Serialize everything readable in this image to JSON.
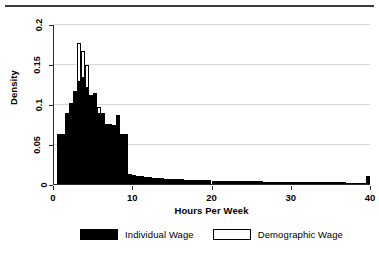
{
  "chart_data": {
    "type": "bar",
    "title": "",
    "subtitle": "",
    "xlabel": "Hours Per Week",
    "ylabel": "Density",
    "xlim": [
      0,
      40
    ],
    "ylim": [
      0,
      0.2
    ],
    "xticks": [
      0,
      10,
      20,
      30,
      40
    ],
    "xtick_labels": [
      "0",
      "10",
      "20",
      "30",
      "40"
    ],
    "yticks": [
      0,
      0.05,
      0.1,
      0.15,
      0.2
    ],
    "ytick_labels": [
      "0",
      "0.05",
      "0.1",
      "0.15",
      "0.2"
    ],
    "grid": "horizontal",
    "legend_position": "bottom",
    "bin_width": 0.5,
    "bin_starts": [
      0,
      0.5,
      1,
      1.5,
      2,
      2.5,
      3,
      3.5,
      4,
      4.5,
      5,
      5.5,
      6,
      6.5,
      7,
      7.5,
      8,
      8.5,
      9,
      9.5,
      10,
      10.5,
      11,
      11.5,
      12,
      12.5,
      13,
      13.5,
      14,
      14.5,
      15,
      15.5,
      16,
      16.5,
      17,
      17.5,
      18,
      18.5,
      19,
      19.5,
      20,
      20.5,
      21,
      21.5,
      22,
      22.5,
      23,
      23.5,
      24,
      24.5,
      25,
      25.5,
      26,
      26.5,
      27,
      27.5,
      28,
      28.5,
      29,
      29.5,
      30,
      30.5,
      31,
      31.5,
      32,
      32.5,
      33,
      33.5,
      34,
      34.5,
      35,
      35.5,
      36,
      36.5,
      37,
      37.5,
      38,
      38.5,
      39,
      39.5
    ],
    "series": [
      {
        "name": "Individual Wage",
        "style": "filled-black",
        "color": "#000000",
        "values": [
          0.0,
          0.064,
          0.064,
          0.09,
          0.103,
          0.118,
          0.13,
          0.1345,
          0.1225,
          0.112,
          0.1155,
          0.0895,
          0.0895,
          0.076,
          0.0765,
          0.0755,
          0.088,
          0.064,
          0.064,
          0.014,
          0.0125,
          0.0115,
          0.0108,
          0.01,
          0.0095,
          0.009,
          0.0086,
          0.0082,
          0.0079,
          0.0076,
          0.0073,
          0.0071,
          0.0069,
          0.0067,
          0.0065,
          0.0063,
          0.0061,
          0.006,
          0.0058,
          0.0057,
          0.0055,
          0.0054,
          0.0053,
          0.0052,
          0.0051,
          0.005,
          0.0049,
          0.0048,
          0.0047,
          0.0046,
          0.0045,
          0.0045,
          0.0044,
          0.0043,
          0.0042,
          0.0042,
          0.0041,
          0.004,
          0.004,
          0.0039,
          0.0038,
          0.0038,
          0.0037,
          0.0037,
          0.0036,
          0.0036,
          0.0035,
          0.0035,
          0.0034,
          0.0034,
          0.0033,
          0.0033,
          0.0032,
          0.0032,
          0.0031,
          0.0031,
          0.003,
          0.003,
          0.0029,
          0.0115
        ]
      },
      {
        "name": "Demographic Wage",
        "style": "white-outline",
        "color": "#ffffff",
        "edge_color": "#000000",
        "values": [
          0.0,
          0.064,
          0.064,
          0.09,
          0.103,
          0.118,
          0.178,
          0.168,
          0.15,
          0.112,
          0.1155,
          0.097,
          0.0895,
          0.076,
          0.0765,
          0.0755,
          0.088,
          0.064,
          0.064,
          0.014,
          0.0125,
          0.0115,
          0.0108,
          0.01,
          0.0095,
          0.009,
          0.0086,
          0.0082,
          0.0079,
          0.0076,
          0.0073,
          0.0071,
          0.0069,
          0.0067,
          0.0065,
          0.0063,
          0.0061,
          0.006,
          0.0058,
          0.0057,
          0.0055,
          0.0054,
          0.0053,
          0.0052,
          0.0051,
          0.005,
          0.0049,
          0.0048,
          0.0047,
          0.0046,
          0.0045,
          0.0045,
          0.0044,
          0.0043,
          0.0042,
          0.0042,
          0.0041,
          0.004,
          0.004,
          0.0039,
          0.0038,
          0.0038,
          0.0037,
          0.0037,
          0.0036,
          0.0036,
          0.0035,
          0.0035,
          0.0034,
          0.0034,
          0.0033,
          0.0033,
          0.0032,
          0.0032,
          0.0031,
          0.0031,
          0.003,
          0.003,
          0.0029,
          0.0115
        ]
      }
    ],
    "legend": [
      {
        "label": "Individual Wage",
        "swatch": "filled"
      },
      {
        "label": "Demographic Wage",
        "swatch": "hollow"
      }
    ]
  }
}
